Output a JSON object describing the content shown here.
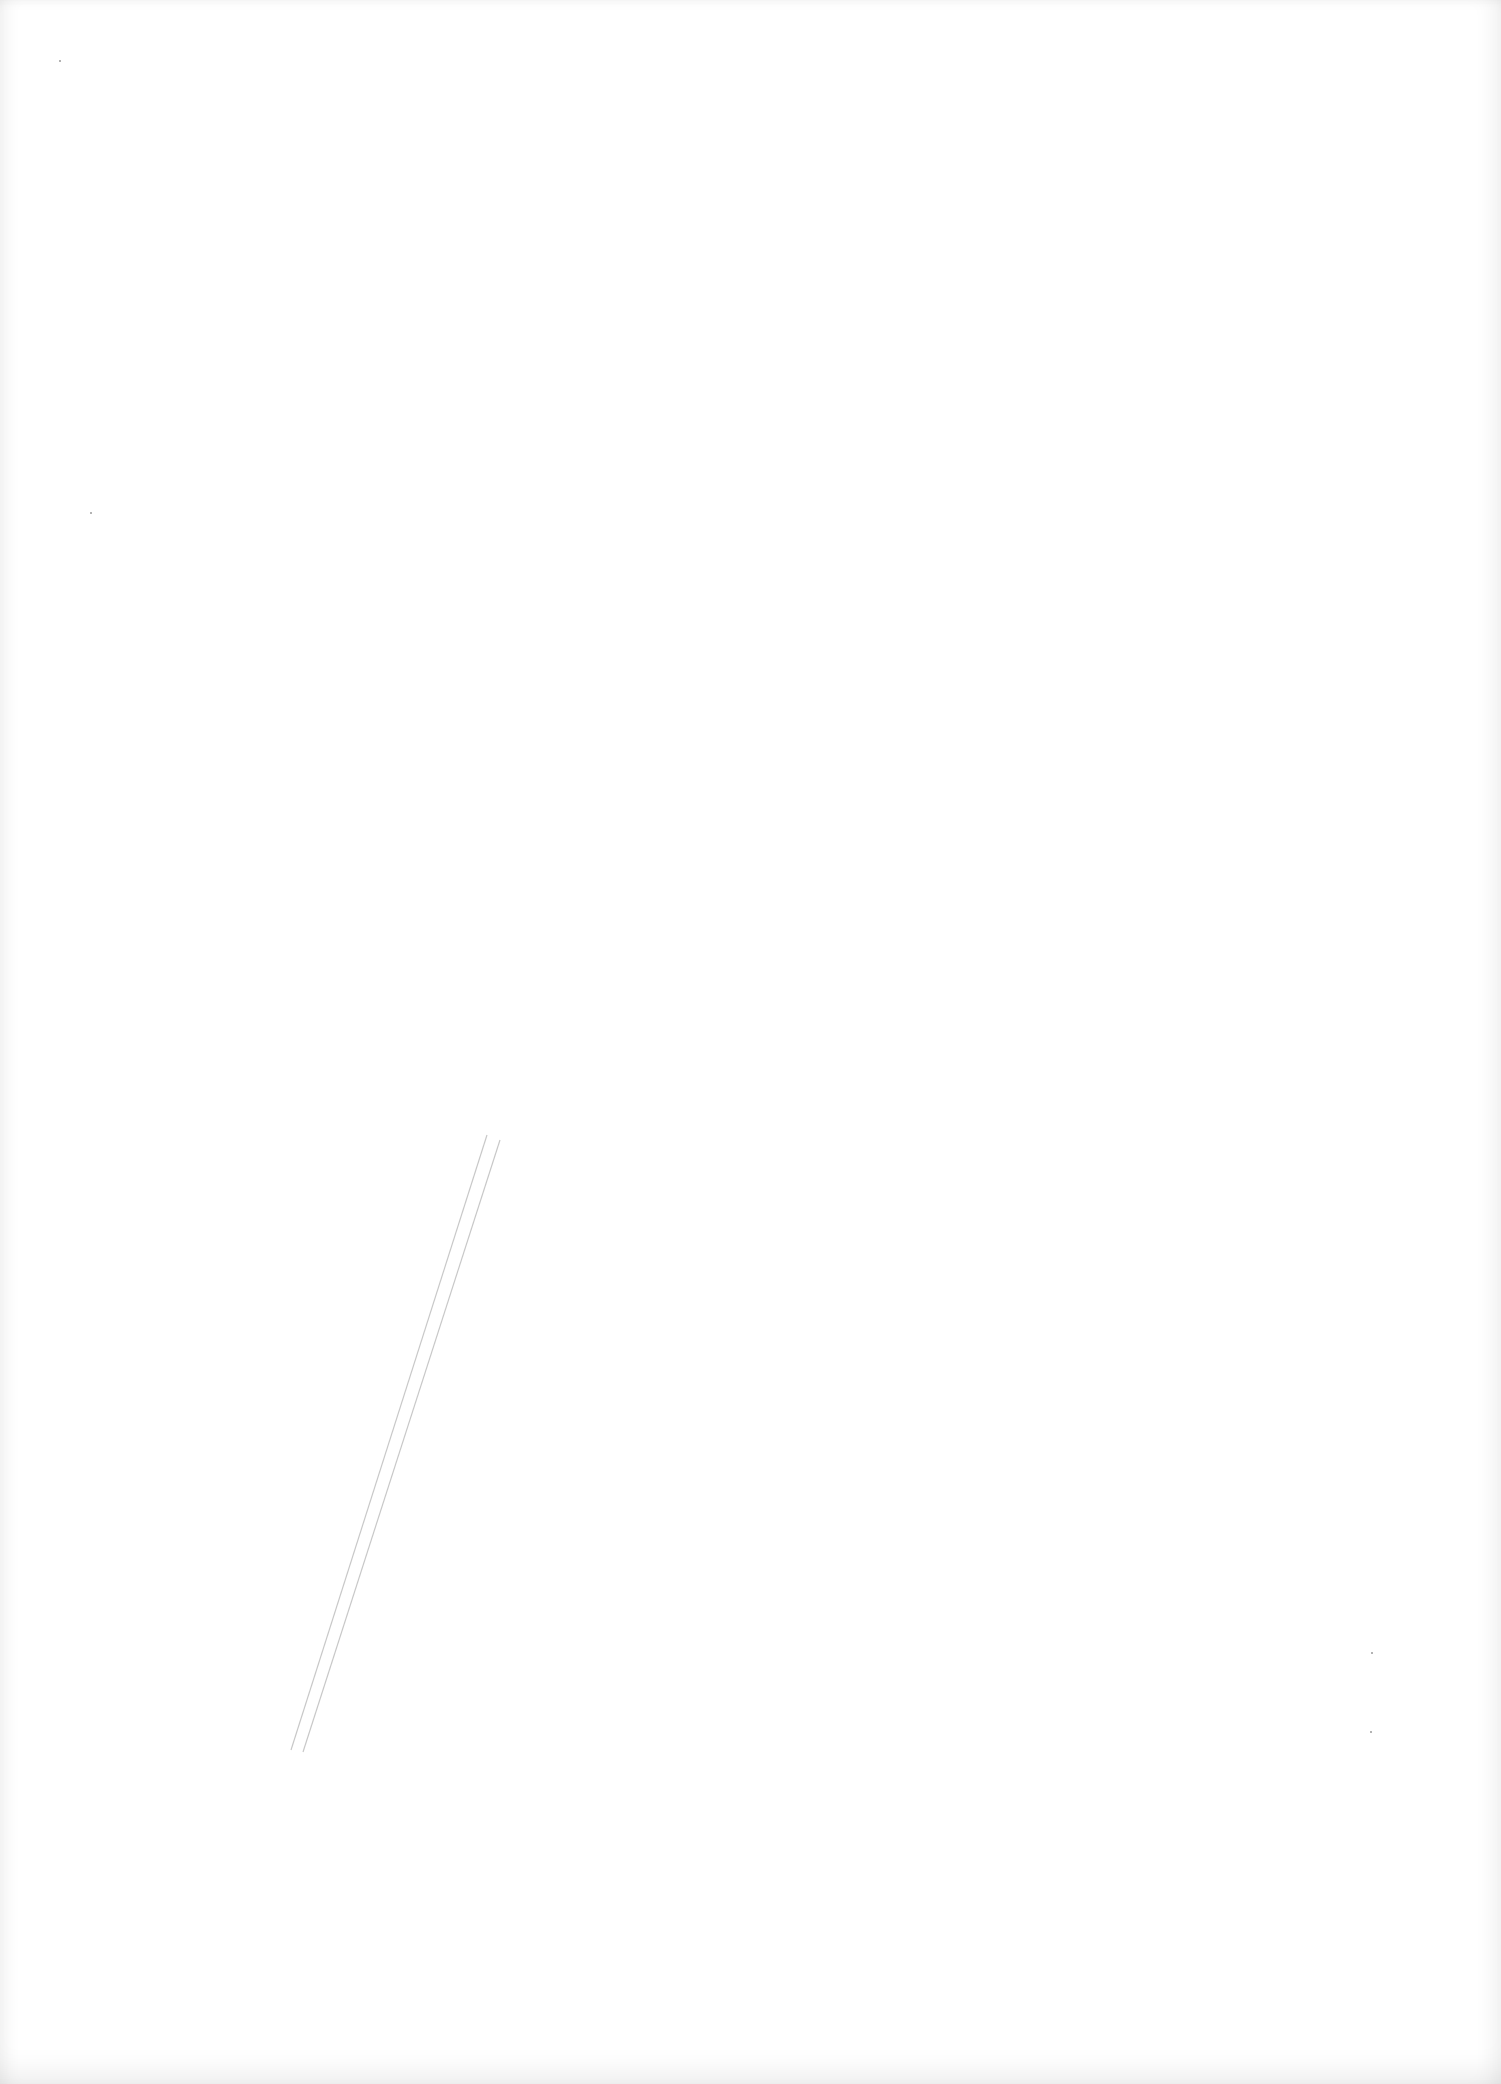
{
  "page": {
    "type": "scanned-blank-page",
    "text": ""
  },
  "marks": {
    "lines": [
      {
        "x1": 487,
        "y1": 1135,
        "x2": 291,
        "y2": 1750
      },
      {
        "x1": 500,
        "y1": 1140,
        "x2": 303,
        "y2": 1752
      }
    ],
    "stroke_color": "#c8c8c8",
    "specks": [
      {
        "x": 1371,
        "y": 1652
      },
      {
        "x": 1370,
        "y": 1731
      },
      {
        "x": 90,
        "y": 512
      },
      {
        "x": 59,
        "y": 60
      }
    ]
  }
}
